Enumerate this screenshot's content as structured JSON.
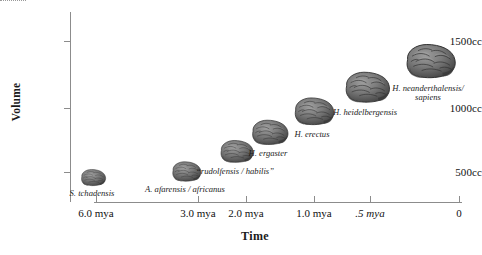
{
  "chart_data": {
    "type": "scatter",
    "title": "",
    "xlabel": "Time",
    "ylabel": "Volume",
    "grid": false,
    "legend": "none",
    "x_axis": {
      "label": "Time",
      "tick_labels": [
        "6.0 mya",
        "3.0 mya",
        "2.0 mya",
        "1.0 mya",
        ".5 mya",
        "0"
      ],
      "tick_values": [
        6.0,
        3.0,
        2.0,
        1.0,
        0.5,
        0
      ],
      "direction": "decreasing-left-to-right",
      "italic_ticks": [
        ".5 mya"
      ],
      "dotted_segment": true
    },
    "y_axis": {
      "label": "Volume",
      "tick_labels": [
        "500cc",
        "1000cc",
        "1500cc"
      ],
      "tick_values": [
        500,
        1000,
        1500
      ],
      "ylim": [
        0,
        1700
      ],
      "unit": "cc"
    },
    "point_marker": "brain-illustration",
    "categories": [
      "S. tchadensis",
      "A. afarensis / africanus",
      "“rudolfensis / habilis”",
      "H. ergaster",
      "H. erectus",
      "H. heidelbergensis",
      "H. neanderthalensis/ sapiens"
    ],
    "x": [
      6.0,
      3.0,
      2.0,
      1.7,
      1.0,
      0.5,
      0.15
    ],
    "values": [
      350,
      450,
      600,
      800,
      950,
      1200,
      1400
    ],
    "points": [
      {
        "species": "S. tchadensis",
        "label_lines": [
          "S. tchadensis"
        ],
        "time": "6.0 mya",
        "volume_cc": 350,
        "x_px": 92,
        "y_px": 178,
        "brain_w": 30,
        "brain_h": 20
      },
      {
        "species": "A. afarensis / africanus",
        "label_lines": [
          "A. afarensis / africanus"
        ],
        "time": "3.0 mya",
        "volume_cc": 450,
        "x_px": 185,
        "y_px": 172,
        "brain_w": 35,
        "brain_h": 24
      },
      {
        "species": "“rudolfensis / habilis”",
        "label_lines": [
          "“rudolfensis / habilis”"
        ],
        "time": "2.0 mya",
        "volume_cc": 600,
        "x_px": 235,
        "y_px": 152,
        "brain_w": 40,
        "brain_h": 27
      },
      {
        "species": "H. ergaster",
        "label_lines": [
          "H. ergaster"
        ],
        "time": "1.7 mya",
        "volume_cc": 800,
        "x_px": 268,
        "y_px": 133,
        "brain_w": 44,
        "brain_h": 30
      },
      {
        "species": "H. erectus",
        "label_lines": [
          "H. erectus"
        ],
        "time": "1.0 mya",
        "volume_cc": 950,
        "x_px": 312,
        "y_px": 112,
        "brain_w": 48,
        "brain_h": 33
      },
      {
        "species": "H. heidelbergensis",
        "label_lines": [
          "H. heidelbergensis"
        ],
        "time": ".5 mya",
        "volume_cc": 1200,
        "x_px": 365,
        "y_px": 88,
        "brain_w": 54,
        "brain_h": 37
      },
      {
        "species": "H. neanderthalensis/ sapiens",
        "label_lines": [
          "H. neanderthalensis/",
          "sapiens"
        ],
        "time": "0",
        "volume_cc": 1400,
        "x_px": 428,
        "y_px": 62,
        "brain_w": 60,
        "brain_h": 41
      }
    ]
  },
  "axis_positions": {
    "y_ticks_px": [
      {
        "label": "1500cc",
        "y": 41
      },
      {
        "label": "1000cc",
        "y": 108
      },
      {
        "label": "500cc",
        "y": 172
      }
    ],
    "x_ticks_px": [
      {
        "label": "6.0 mya",
        "x": 96
      },
      {
        "label": "3.0 mya",
        "x": 198
      },
      {
        "label": "2.0 mya",
        "x": 246
      },
      {
        "label": "1.0 mya",
        "x": 314
      },
      {
        "label": ".5 mya",
        "x": 370
      },
      {
        "label": "0",
        "x": 459
      }
    ]
  },
  "colors": {
    "axis": "#8c8c8c",
    "text": "#111111",
    "background": "#ffffff",
    "brain": "#6e6e6e"
  }
}
